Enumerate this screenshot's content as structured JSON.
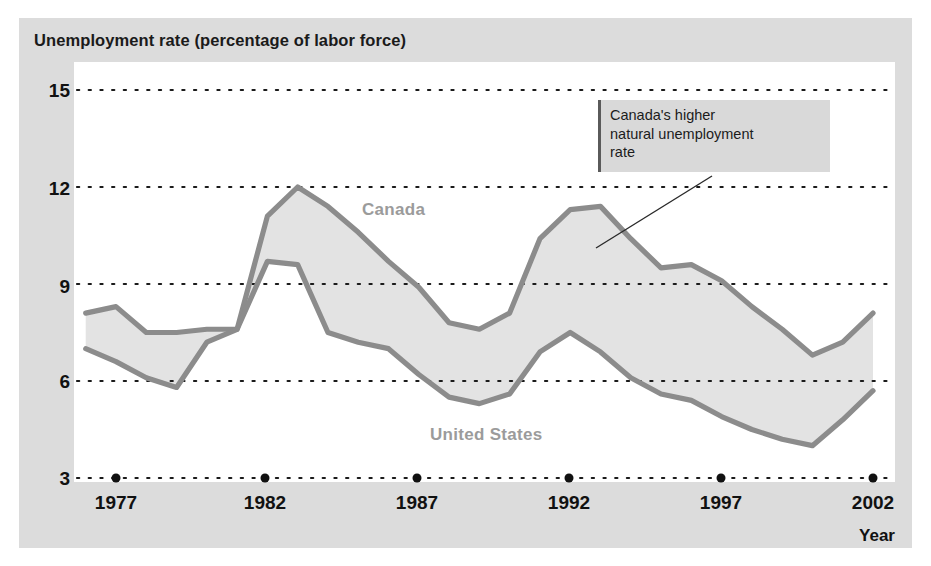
{
  "chart_data": {
    "type": "area",
    "title": "Unemployment rate (percentage of labor force)",
    "xlabel": "Year",
    "ylabel": "",
    "xlim": [
      1976,
      2002
    ],
    "ylim": [
      3,
      15
    ],
    "yticks": [
      15,
      12,
      9,
      6,
      3
    ],
    "xticks": [
      1977,
      1982,
      1987,
      1992,
      1997,
      2002
    ],
    "grid": "horizontal-dotted",
    "legend": "in-plot-labels",
    "x": [
      1976,
      1977,
      1978,
      1979,
      1980,
      1981,
      1982,
      1983,
      1984,
      1985,
      1986,
      1987,
      1988,
      1989,
      1990,
      1991,
      1992,
      1993,
      1994,
      1995,
      1996,
      1997,
      1998,
      1999,
      2000,
      2001,
      2002
    ],
    "series": [
      {
        "name": "Canada",
        "color": "#8c8c8c",
        "values": [
          8.1,
          8.3,
          7.5,
          7.5,
          7.6,
          7.6,
          11.1,
          12.0,
          11.4,
          10.6,
          9.7,
          8.9,
          7.8,
          7.6,
          8.1,
          10.4,
          11.3,
          11.4,
          10.4,
          9.5,
          9.6,
          9.1,
          8.3,
          7.6,
          6.8,
          7.2,
          8.1
        ]
      },
      {
        "name": "United States",
        "color": "#8c8c8c",
        "values": [
          7.0,
          6.6,
          6.1,
          5.8,
          7.2,
          7.6,
          9.7,
          9.6,
          7.5,
          7.2,
          7.0,
          6.2,
          5.5,
          5.3,
          5.6,
          6.9,
          7.5,
          6.9,
          6.1,
          5.6,
          5.4,
          4.9,
          4.5,
          4.2,
          4.0,
          4.8,
          5.7
        ]
      }
    ],
    "annotation": {
      "line1": "Canada's higher",
      "line2": "natural unemployment",
      "line3": "rate"
    }
  },
  "colors": {
    "mat": "#dcdcdc",
    "panel": "#ffffff",
    "line": "#8c8c8c",
    "band_fill": "#e3e3e3",
    "grid": "#1a1a1a",
    "text": "#111111",
    "series_label": "#9b9b9b",
    "annotation_bg": "#d9d9d9",
    "annotation_rule": "#5a5a5a"
  }
}
